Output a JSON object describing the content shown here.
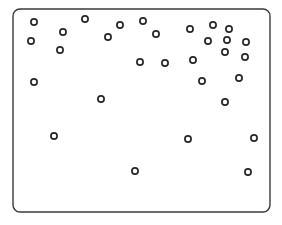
{
  "figure": {
    "name": "scatter-plot-panel",
    "background_color": "#ffffff",
    "frame": {
      "x": 13,
      "y": 9,
      "width": 257,
      "height": 203,
      "corner_radius": 7,
      "stroke_color": "#3a3a3a",
      "stroke_width": 1.4,
      "fill_color": "#ffffff"
    },
    "marker": {
      "shape": "open-circle",
      "radius": 3.1,
      "stroke_color": "#262626",
      "stroke_width": 1.7,
      "fill_color": "#ffffff"
    }
  },
  "chart_data": {
    "type": "scatter",
    "title": "",
    "subtitle": "",
    "xlabel": "",
    "ylabel": "",
    "xlim": [
      13,
      270
    ],
    "ylim": [
      9,
      212
    ],
    "grid": false,
    "legend": null,
    "axis_ticks": false,
    "point_count": 34,
    "series": [
      {
        "name": "points",
        "marker": "open-circle",
        "color": "#262626",
        "points": [
          {
            "x": 34,
            "y": 22
          },
          {
            "x": 63,
            "y": 32
          },
          {
            "x": 31,
            "y": 41
          },
          {
            "x": 85,
            "y": 19
          },
          {
            "x": 60,
            "y": 50
          },
          {
            "x": 120,
            "y": 25
          },
          {
            "x": 108,
            "y": 37
          },
          {
            "x": 143,
            "y": 21
          },
          {
            "x": 156,
            "y": 34
          },
          {
            "x": 190,
            "y": 29
          },
          {
            "x": 213,
            "y": 25
          },
          {
            "x": 229,
            "y": 29
          },
          {
            "x": 208,
            "y": 41
          },
          {
            "x": 227,
            "y": 40
          },
          {
            "x": 246,
            "y": 42
          },
          {
            "x": 225,
            "y": 52
          },
          {
            "x": 245,
            "y": 57
          },
          {
            "x": 140,
            "y": 62
          },
          {
            "x": 165,
            "y": 63
          },
          {
            "x": 193,
            "y": 60
          },
          {
            "x": 34,
            "y": 82
          },
          {
            "x": 202,
            "y": 81
          },
          {
            "x": 239,
            "y": 78
          },
          {
            "x": 101,
            "y": 99
          },
          {
            "x": 225,
            "y": 102
          },
          {
            "x": 54,
            "y": 136
          },
          {
            "x": 188,
            "y": 139
          },
          {
            "x": 254,
            "y": 138
          },
          {
            "x": 135,
            "y": 171
          },
          {
            "x": 248,
            "y": 172
          }
        ]
      }
    ]
  }
}
